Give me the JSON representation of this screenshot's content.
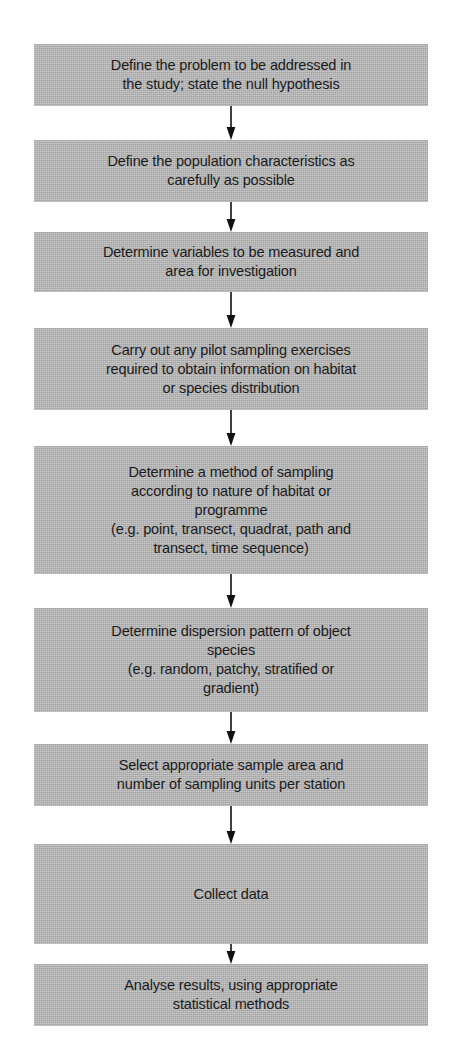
{
  "diagram": {
    "orientation": "vertical-top-to-bottom",
    "box_fill_color": "#b4b4b4",
    "text_color": "#1b1b1b",
    "background_color": "#ffffff",
    "arrow_color": "#111111",
    "nodes": [
      {
        "id": "define-problem",
        "text": "Define the problem to be addressed in\nthe study; state the null hypothesis",
        "top": 44,
        "height": 62
      },
      {
        "id": "define-population",
        "text": "Define the population characteristics as\ncarefully as possible",
        "top": 140,
        "height": 62
      },
      {
        "id": "determine-variables",
        "text": "Determine variables to be measured and\narea for investigation",
        "top": 232,
        "height": 60
      },
      {
        "id": "pilot-sampling",
        "text": "Carry out any pilot sampling exercises\nrequired to obtain information on habitat\nor species distribution",
        "top": 328,
        "height": 82
      },
      {
        "id": "sampling-method",
        "text": "Determine a method of sampling\naccording to nature of habitat or\nprogramme\n(e.g. point, transect, quadrat, path and\ntransect, time sequence)",
        "top": 446,
        "height": 128
      },
      {
        "id": "dispersion-pattern",
        "text": "Determine dispersion pattern of object\nspecies\n(e.g. random, patchy, stratified or\ngradient)",
        "top": 608,
        "height": 104
      },
      {
        "id": "sample-area",
        "text": "Select appropriate sample area and\nnumber of sampling units per station",
        "top": 744,
        "height": 62
      },
      {
        "id": "collect-data",
        "text": "Collect data",
        "top": 844,
        "height": 100
      },
      {
        "id": "analyse-results",
        "text": "Analyse results, using appropriate\nstatistical methods",
        "top": 964,
        "height": 62
      }
    ],
    "connectors": [
      {
        "id": "arrow-1",
        "from": "define-problem",
        "to": "define-population",
        "top": 106,
        "height": 34
      },
      {
        "id": "arrow-2",
        "from": "define-population",
        "to": "determine-variables",
        "top": 202,
        "height": 30
      },
      {
        "id": "arrow-3",
        "from": "determine-variables",
        "to": "pilot-sampling",
        "top": 292,
        "height": 36
      },
      {
        "id": "arrow-4",
        "from": "pilot-sampling",
        "to": "sampling-method",
        "top": 410,
        "height": 36
      },
      {
        "id": "arrow-5",
        "from": "sampling-method",
        "to": "dispersion-pattern",
        "top": 574,
        "height": 34
      },
      {
        "id": "arrow-6",
        "from": "dispersion-pattern",
        "to": "sample-area",
        "top": 712,
        "height": 32
      },
      {
        "id": "arrow-7",
        "from": "sample-area",
        "to": "collect-data",
        "top": 806,
        "height": 38
      },
      {
        "id": "arrow-8",
        "from": "collect-data",
        "to": "analyse-results",
        "top": 944,
        "height": 20
      }
    ]
  }
}
